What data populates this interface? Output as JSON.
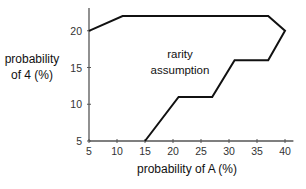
{
  "chart_data": {
    "type": "line",
    "subtype": "closed-polygon-region",
    "title": "",
    "xlabel": "probability of A (%)",
    "ylabel": [
      "probability",
      "of 4  (%)"
    ],
    "xlim": [
      5,
      41
    ],
    "ylim": [
      5,
      23
    ],
    "x_ticks": [
      5,
      10,
      15,
      20,
      25,
      30,
      35,
      40
    ],
    "y_ticks": [
      5,
      10,
      15,
      20
    ],
    "grid": false,
    "legend": null,
    "annotations": [
      {
        "text": [
          "rarity",
          "assumption"
        ],
        "x": 21,
        "y": 17.5
      }
    ],
    "series": [
      {
        "name": "rarity assumption boundary",
        "color": "#111111",
        "points": [
          {
            "x": 5,
            "y": 20
          },
          {
            "x": 11,
            "y": 22
          },
          {
            "x": 37,
            "y": 22
          },
          {
            "x": 40,
            "y": 20
          },
          {
            "x": 37,
            "y": 16
          },
          {
            "x": 31,
            "y": 16
          },
          {
            "x": 27,
            "y": 11
          },
          {
            "x": 21,
            "y": 11
          },
          {
            "x": 15,
            "y": 5
          }
        ]
      }
    ]
  },
  "labels": {
    "xlabel": "probability of A (%)",
    "ylabel_line1": "probability",
    "ylabel_line2": "of 4  (%)",
    "annot_line1": "rarity",
    "annot_line2": "assumption"
  },
  "colors": {
    "line": "#111111",
    "axis": "#555555",
    "background": "#ffffff"
  }
}
